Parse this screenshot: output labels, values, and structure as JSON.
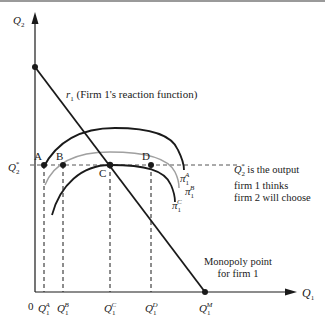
{
  "diagram": {
    "axes": {
      "y_label": "Q",
      "y_sub": "2",
      "x_label": "Q",
      "x_sub": "1",
      "origin": "0"
    },
    "reaction_function": {
      "symbol": "r",
      "sub": "1",
      "label": "(Firm 1's reaction function)"
    },
    "q2_star": {
      "label": "Q",
      "sub": "2",
      "sup": "*",
      "note_line1": "is the output",
      "note_line2": "firm 1 thinks",
      "note_line3": "firm 2 will choose"
    },
    "points": {
      "A": "A",
      "B": "B",
      "C": "C",
      "D": "D"
    },
    "isoprofit_curves": [
      {
        "symbol": "π",
        "sub": "1",
        "sup": "A",
        "color": "#1a1a1a"
      },
      {
        "symbol": "π",
        "sub": "1",
        "sup": "B",
        "color": "#9a9a9a"
      },
      {
        "symbol": "π",
        "sub": "1",
        "sup": "C",
        "color": "#1a1a1a"
      }
    ],
    "x_ticks": [
      {
        "base": "Q",
        "sub": "1",
        "sup": "A"
      },
      {
        "base": "Q",
        "sub": "1",
        "sup": "B"
      },
      {
        "base": "Q",
        "sub": "1",
        "sup": "C"
      },
      {
        "base": "Q",
        "sub": "1",
        "sup": "D"
      },
      {
        "base": "Q",
        "sub": "1",
        "sup": "M"
      }
    ],
    "monopoly": {
      "line1": "Monopoly point",
      "line2": "for firm 1"
    }
  }
}
